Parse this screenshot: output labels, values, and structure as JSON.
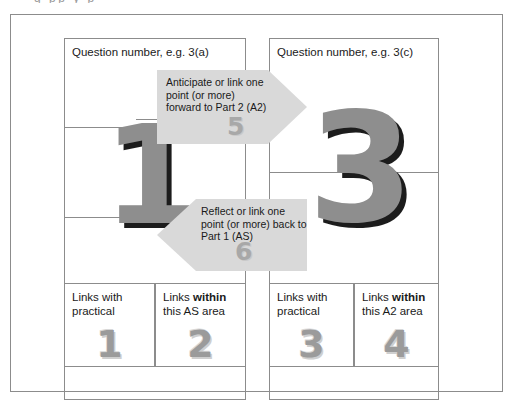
{
  "caption_remnant": "g  pp            y  p",
  "diagram": {
    "panels": [
      {
        "id": "as",
        "title": "Question number, e.g. 3(a)",
        "cells": [
          {
            "label_plain": "Links with",
            "label_line2_pre": "practical",
            "label_line2_bold": "",
            "number": "1"
          },
          {
            "label_plain": "Links ",
            "label_bold": "within",
            "label_line2": "this AS area",
            "number": "2"
          }
        ],
        "big_number": "1"
      },
      {
        "id": "a2",
        "title": "Question number, e.g. 3(c)",
        "cells": [
          {
            "label_plain": "Links with",
            "label_line2_pre": "practical",
            "label_line2_bold": "",
            "number": "3"
          },
          {
            "label_plain": "Links ",
            "label_bold": "within",
            "label_line2": "this A2 area",
            "number": "4"
          }
        ],
        "big_number": "3"
      }
    ],
    "cells_flat": [
      {
        "line1_pre": "Links with",
        "line1_bold": "",
        "line2": "practical",
        "number": "1"
      },
      {
        "line1_pre": "Links ",
        "line1_bold": "within",
        "line2": "this AS area",
        "number": "2"
      },
      {
        "line1_pre": "Links with",
        "line1_bold": "",
        "line2": "practical",
        "number": "3"
      },
      {
        "line1_pre": "Links ",
        "line1_bold": "within",
        "line2": "this A2 area",
        "number": "4"
      }
    ],
    "arrows": [
      {
        "id": "forward",
        "direction": "right",
        "text": "Anticipate or link one point (or more) forward to Part 2 (A2)",
        "number": "5"
      },
      {
        "id": "back",
        "direction": "left",
        "text": "Reflect or link one point (or more) back to Part 1 (AS)",
        "number": "6"
      }
    ],
    "colors": {
      "arrow_fill": "#d9d9d9",
      "big_numeral": "#8e8e8e",
      "big_numeral_shadow": "#1c1c1c",
      "cell_numeral": "#9b9b9b",
      "border": "#8c8c8c",
      "text": "#1a1a1a",
      "background": "#ffffff"
    }
  }
}
